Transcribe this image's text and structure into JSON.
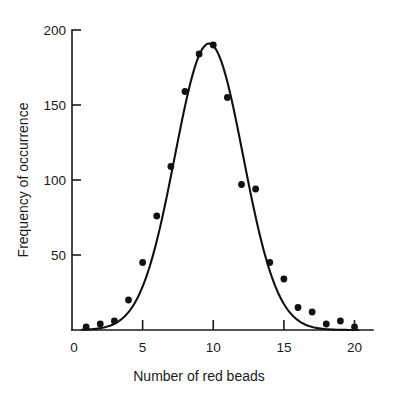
{
  "chart_data": {
    "type": "scatter",
    "title": "",
    "xlabel": "Number of red beads",
    "ylabel": "Frequency of occurrence",
    "xlim": [
      0,
      20.6
    ],
    "ylim": [
      0,
      200
    ],
    "xticks": [
      0,
      5,
      10,
      15,
      20
    ],
    "xtick_labels": [
      "0",
      "5",
      "10",
      "15",
      "20"
    ],
    "yticks": [
      50,
      100,
      150,
      200
    ],
    "ytick_labels": [
      "50",
      "100",
      "150",
      "200"
    ],
    "grid": false,
    "legend": null,
    "x": [
      1,
      2,
      3,
      4,
      5,
      6,
      7,
      8,
      9,
      10,
      11,
      12,
      13,
      14,
      15,
      16,
      17,
      18,
      19,
      20
    ],
    "values": [
      2,
      4,
      6,
      20,
      45,
      76,
      109,
      159,
      184,
      190,
      155,
      97,
      94,
      45,
      34,
      15,
      12,
      4,
      6,
      2
    ],
    "series": [
      {
        "name": "Observed frequency",
        "marker": "filled-circle",
        "color": "#111111",
        "values": [
          2,
          4,
          6,
          20,
          45,
          76,
          109,
          159,
          184,
          190,
          155,
          97,
          94,
          45,
          34,
          15,
          12,
          4,
          6,
          2
        ]
      },
      {
        "name": "Fitted binomial curve",
        "marker": "line",
        "color": "#111111",
        "fit": {
          "peak_x": 9.7,
          "peak_y": 191,
          "sigma": 2.42
        }
      }
    ]
  },
  "axes": {
    "x_axis_name": "x-axis",
    "y_axis_name": "y-axis",
    "origin_label": "0"
  }
}
